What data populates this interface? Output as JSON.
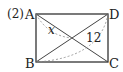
{
  "problem_number": "(2)",
  "vertices": {
    "A": "A",
    "B": "B",
    "C": "C",
    "D": "D"
  },
  "labels": {
    "angle_segment": "x",
    "diagonal_length": "12"
  },
  "colors": {
    "stroke": "#333333",
    "dashed": "#888888"
  }
}
